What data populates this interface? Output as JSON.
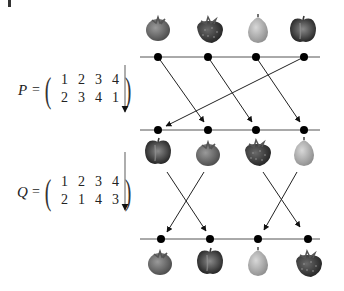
{
  "figure": {
    "matrices": [
      {
        "name": "P",
        "top_row": [
          "1",
          "2",
          "3",
          "4"
        ],
        "bottom_row": [
          "2",
          "3",
          "4",
          "1"
        ]
      },
      {
        "name": "Q",
        "top_row": [
          "1",
          "2",
          "3",
          "4"
        ],
        "bottom_row": [
          "2",
          "1",
          "4",
          "3"
        ]
      }
    ],
    "equals": "=",
    "rows": [
      {
        "fruits": [
          "tomato",
          "strawberry",
          "pear",
          "apple"
        ]
      },
      {
        "fruits": [
          "apple",
          "tomato",
          "strawberry",
          "pear"
        ]
      },
      {
        "fruits": [
          "tomato",
          "apple",
          "pear",
          "strawberry"
        ]
      }
    ],
    "colors": {
      "line": "#333333",
      "dot": "#000000",
      "tomato": "#7a7a7a",
      "strawberry": "#444444",
      "pear": "#bdbdbd",
      "apple": "#555555"
    }
  }
}
